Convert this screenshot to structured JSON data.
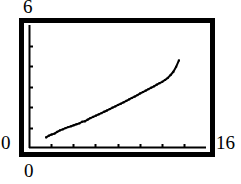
{
  "figure": {
    "name": "line-plot",
    "background_color": "#ffffff",
    "foreground_color": "#000000"
  },
  "labels": {
    "y_max": "6",
    "y_min": "0",
    "x_min": "0",
    "x_max": "16"
  },
  "chart_data": {
    "type": "line",
    "title": "",
    "xlabel": "",
    "ylabel": "",
    "xlim": [
      0,
      16
    ],
    "ylim": [
      0,
      6
    ],
    "grid": false,
    "legend": false,
    "frame": "box",
    "x_ticks": [
      2,
      4,
      6,
      8,
      10,
      12,
      14
    ],
    "y_ticks": [
      1,
      2,
      3,
      4,
      5
    ],
    "x_tick_labels": [
      "",
      "",
      "",
      "",
      "",
      "",
      ""
    ],
    "y_tick_labels": [
      "",
      "",
      "",
      "",
      ""
    ],
    "series": [
      {
        "name": "series-1",
        "marker": "dot",
        "line_color": "#000000",
        "x": [
          1.55,
          1.8,
          2.05,
          2.3,
          2.55,
          2.8,
          3.05,
          3.3,
          3.55,
          3.8,
          4.05,
          4.3,
          4.55,
          4.8,
          5.05,
          5.3,
          5.55,
          5.8,
          6.05,
          6.3,
          6.55,
          6.8,
          7.05,
          7.3,
          7.55,
          7.8,
          8.05,
          8.3,
          8.55,
          8.8,
          9.05,
          9.3,
          9.55,
          9.8,
          10.05,
          10.3,
          10.55,
          10.8,
          11.05,
          11.3,
          11.55,
          11.8,
          12.05,
          12.3,
          12.55,
          12.8,
          13.05,
          13.3,
          13.55
        ],
        "y": [
          0.52,
          0.6,
          0.66,
          0.7,
          0.79,
          0.86,
          0.91,
          0.97,
          1.02,
          1.06,
          1.11,
          1.16,
          1.2,
          1.28,
          1.3,
          1.38,
          1.46,
          1.52,
          1.58,
          1.64,
          1.7,
          1.77,
          1.83,
          1.9,
          1.97,
          2.03,
          2.1,
          2.16,
          2.23,
          2.3,
          2.37,
          2.44,
          2.51,
          2.58,
          2.66,
          2.73,
          2.8,
          2.87,
          2.94,
          3.01,
          3.09,
          3.16,
          3.23,
          3.32,
          3.42,
          3.56,
          3.72,
          3.96,
          4.27
        ]
      }
    ]
  },
  "geometry": {
    "outer_frame": {
      "x": 19,
      "y": 18,
      "width": 196,
      "height": 139,
      "stroke_width": 5
    },
    "plot_area": {
      "x": 29,
      "y": 25,
      "width": 177,
      "height": 123
    },
    "axis_stroke_width": 2,
    "tick_length": 4,
    "data_stroke_width": 2
  }
}
